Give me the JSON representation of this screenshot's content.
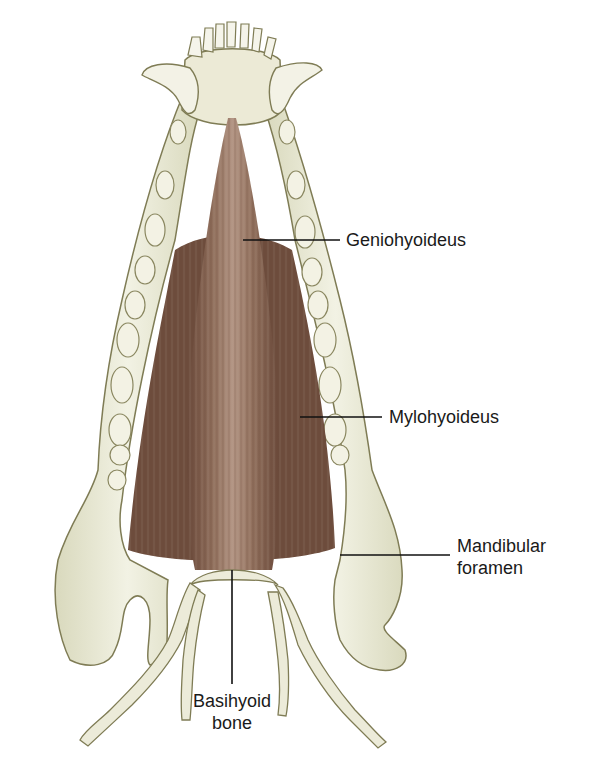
{
  "figure": {
    "colors": {
      "bone": "#e9ead8",
      "bone_shadow": "#b7b48a",
      "bone_outline": "#7f7c55",
      "muscle": "#8a6a5a",
      "muscle_dark": "#5e4032",
      "muscle_light": "#b89a8a",
      "leader_line": "#111111",
      "label_text": "#1a1a1a"
    }
  },
  "labels": {
    "geniohyoideus": "Geniohyoideus",
    "mylohyoideus": "Mylohyoideus",
    "mandibular_foramen_line1": "Mandibular",
    "mandibular_foramen_line2": "foramen",
    "basihyoid_line1": "Basihyoid",
    "basihyoid_line2": "bone"
  }
}
